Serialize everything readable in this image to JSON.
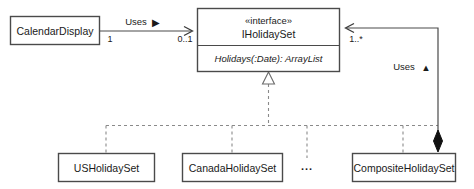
{
  "diagram": {
    "background_color": "#ffffff",
    "line_color": "#4a4a4a",
    "dashed_line_color": "#8a8a8a",
    "text_color": "#1a1a1a",
    "classes": {
      "calendar_display": {
        "name": "CalendarDisplay"
      },
      "interface": {
        "stereotype": "«interface»",
        "name": "IHolidaySet",
        "method": "Holidays(:Date): ArrayList"
      },
      "us_holiday_set": {
        "name": "USHolidaySet"
      },
      "canada_holiday_set": {
        "name": "CanadaHolidaySet"
      },
      "composite_holiday_set": {
        "name": "CompositeHolidaySet"
      },
      "more": {
        "name": "..."
      }
    },
    "relations": {
      "uses_association": {
        "label": "Uses",
        "direction_marker": "▶",
        "source_multiplicity": "1",
        "target_multiplicity": "0..1"
      },
      "uses_composition": {
        "label": "Uses",
        "direction_marker": "▲",
        "target_multiplicity": "1..*"
      }
    }
  }
}
